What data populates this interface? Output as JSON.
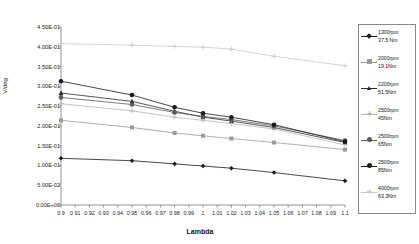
{
  "chart_data": {
    "type": "line",
    "title": "",
    "xlabel": "Lambda",
    "ylabel": "V/deg",
    "xlim": [
      0.9,
      1.1
    ],
    "ylim": [
      0.0,
      0.45
    ],
    "grid": false,
    "legend_position": "right",
    "xticks": [
      "0.9",
      "0.91",
      "0.92",
      "0.93",
      "0.94",
      "0.95",
      "0.96",
      "0.97",
      "0.98",
      "0.99",
      "1",
      "1.01",
      "1.02",
      "1.03",
      "1.04",
      "1.05",
      "1.06",
      "1.07",
      "1.08",
      "1.09",
      "1.1"
    ],
    "yticks": [
      "0.00E+00",
      "5.00E-02",
      "1.00E-01",
      "1.50E-01",
      "2.00E-01",
      "2.50E-01",
      "3.00E-01",
      "3.50E-01",
      "4.00E-01",
      "4.50E-01"
    ],
    "x": [
      0.9,
      0.95,
      0.98,
      1.0,
      1.02,
      1.05,
      1.1
    ],
    "series": [
      {
        "name": "1300rpm 37.5 Nm",
        "label_line1": "1300rpm",
        "label_line2": "37.5 Nm",
        "marker": "diamond",
        "color": "#1a1a1a",
        "values": [
          0.118,
          0.112,
          0.104,
          0.0985,
          0.093,
          0.082,
          0.061
        ]
      },
      {
        "name": "2000rpm 19.1Nm",
        "label_line1": "2000rpm",
        "label_line2": "19.1Nm",
        "marker": "square",
        "color": "#9a9a9a",
        "values": [
          0.214,
          0.196,
          0.182,
          0.175,
          0.168,
          0.158,
          0.14
        ]
      },
      {
        "name": "2200rpm 51.5Nm",
        "label_line1": "2200rpm",
        "label_line2": "51.5Nm",
        "marker": "triangle",
        "color": "#2b2b2b",
        "values": [
          0.283,
          0.262,
          0.237,
          0.222,
          0.212,
          0.196,
          0.158
        ]
      },
      {
        "name": "2500rpm 45Nm",
        "label_line1": "2500rpm",
        "label_line2": "45Nm",
        "marker": "plus",
        "color": "#b5b5b5",
        "values": [
          0.256,
          0.238,
          0.222,
          0.214,
          0.206,
          0.192,
          0.152
        ]
      },
      {
        "name": "2500rpm 65Nm",
        "label_line1": "2500rpm",
        "label_line2": "65Nm",
        "marker": "circle",
        "color": "#5a5a5a",
        "values": [
          0.272,
          0.254,
          0.234,
          0.224,
          0.216,
          0.2,
          0.163
        ]
      },
      {
        "name": "2500rpm 85Nm",
        "label_line1": "2500rpm",
        "label_line2": "85Nm",
        "marker": "circle-dark",
        "color": "#1a1a1a",
        "values": [
          0.313,
          0.278,
          0.247,
          0.232,
          0.222,
          0.203,
          0.16
        ]
      },
      {
        "name": "4000rpm 63.3Nm",
        "label_line1": "4000rpm",
        "label_line2": "63.3Nm",
        "marker": "plus-light",
        "color": "#c8c8c8",
        "values": [
          0.408,
          0.404,
          0.401,
          0.399,
          0.394,
          0.376,
          0.352
        ]
      }
    ]
  }
}
